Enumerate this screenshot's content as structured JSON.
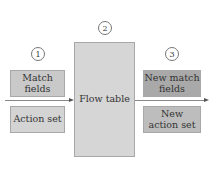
{
  "diagram": {
    "steps": [
      {
        "number": "1"
      },
      {
        "number": "2"
      },
      {
        "number": "3"
      }
    ],
    "input": {
      "match_fields": "Match fields",
      "action_set": "Action set"
    },
    "flow_table": {
      "label": "Flow table"
    },
    "output": {
      "new_match_fields": "New match fields",
      "new_action_set": "New action set"
    },
    "colors": {
      "input_box": "#c9c9c9",
      "action_box": "#d4d4d4",
      "flow_table": "#d6d6d6",
      "output_match": "#a9a9a9",
      "output_action": "#bdbdbd"
    }
  }
}
